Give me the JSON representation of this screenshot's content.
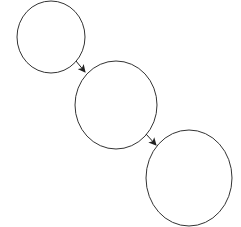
{
  "diagram": {
    "background": "#ffffff",
    "stroke_color": "#333333",
    "nodes": [
      {
        "id": "node-1",
        "label": "",
        "cx": 51,
        "cy": 37,
        "rx": 34,
        "ry": 36
      },
      {
        "id": "node-2",
        "label": "",
        "cx": 116,
        "cy": 105,
        "rx": 41,
        "ry": 44
      },
      {
        "id": "node-3",
        "label": "",
        "cx": 189,
        "cy": 178,
        "rx": 43,
        "ry": 48
      }
    ],
    "edges": [
      {
        "from": "node-1",
        "to": "node-2",
        "x1": 76,
        "y1": 61,
        "x2": 85,
        "y2": 72
      },
      {
        "from": "node-2",
        "to": "node-3",
        "x1": 146,
        "y1": 134,
        "x2": 156,
        "y2": 145
      }
    ]
  }
}
